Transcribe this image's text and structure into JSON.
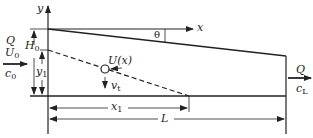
{
  "diagram": {
    "type": "settling-basin-schematic",
    "colors": {
      "line": "#222222",
      "background": "#ffffff"
    },
    "labels": {
      "y_axis": "y",
      "x_axis": "x",
      "theta": "θ",
      "inflow_Q": "Q",
      "inflow_U": "U",
      "inflow_U_sub": "0",
      "inflow_c": "c",
      "inflow_c_sub": "0",
      "H": "H",
      "H_sub": "0",
      "y1": "y",
      "y1_sub": "1",
      "particle_U": "U(x)",
      "vt": "v",
      "vt_sub": "t",
      "x1": "x",
      "x1_sub": "1",
      "L": "L",
      "outflow_Q": "Q",
      "outflow_c": "c",
      "outflow_c_sub": "L"
    }
  }
}
